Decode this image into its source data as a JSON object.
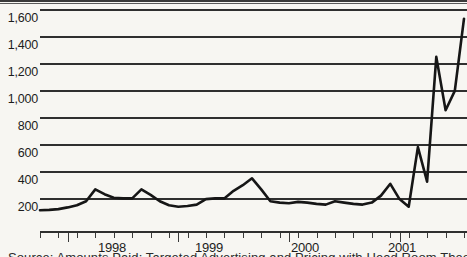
{
  "chart_data": {
    "type": "line",
    "title": "",
    "subtitle": "",
    "xlabel": "",
    "ylabel": "",
    "ylim": [
      0,
      1600
    ],
    "ytick_values": [
      200,
      400,
      600,
      800,
      1000,
      1200,
      1400,
      1600
    ],
    "ytick_labels": [
      "200",
      "400",
      "600",
      "800",
      "1,000",
      "1,200",
      "1,400",
      "1,600"
    ],
    "grid": true,
    "legend": null,
    "xtick_labels": [
      "1998",
      "1999",
      "2000",
      "2001"
    ],
    "x_axis_note": "monthly/quarterly minor ticks with major ticks at year boundaries",
    "series": [
      {
        "name": "value",
        "color": "#1a1a1a",
        "x": [
          "1997-10",
          "1997-11",
          "1997-12",
          "1998-01",
          "1998-02",
          "1998-03",
          "1998-04",
          "1998-05",
          "1998-06",
          "1998-07",
          "1998-08",
          "1998-09",
          "1998-10",
          "1998-11",
          "1998-12",
          "1999-01",
          "1999-02",
          "1999-03",
          "1999-04",
          "1999-05",
          "1999-06",
          "1999-07",
          "1999-08",
          "1999-09",
          "1999-10",
          "1999-11",
          "1999-12",
          "2000-01",
          "2000-02",
          "2000-03",
          "2000-04",
          "2000-05",
          "2000-06",
          "2000-07",
          "2000-08",
          "2000-09",
          "2000-10",
          "2000-11",
          "2000-12",
          "2001-01",
          "2001-02",
          "2001-03",
          "2001-04",
          "2001-05",
          "2001-06",
          "2001-07",
          "2001-08"
        ],
        "values": [
          150,
          152,
          158,
          170,
          185,
          215,
          300,
          265,
          240,
          235,
          235,
          300,
          260,
          215,
          185,
          175,
          180,
          190,
          230,
          235,
          235,
          290,
          330,
          380,
          300,
          215,
          205,
          200,
          210,
          205,
          195,
          190,
          215,
          205,
          195,
          190,
          205,
          255,
          340,
          230,
          175,
          605,
          355,
          1255,
          870,
          1010,
          1530
        ]
      }
    ]
  },
  "axis": {
    "y_labels": [
      "1,600",
      "1,400",
      "1,200",
      "1,000",
      "800",
      "600",
      "400",
      "200"
    ],
    "x_labels": [
      "1998",
      "1999",
      "2000",
      "2001"
    ]
  },
  "footer": {
    "source_text": "Source: Amounts Paid: Targeted Advertising and Pricing with Head Room Theory"
  }
}
